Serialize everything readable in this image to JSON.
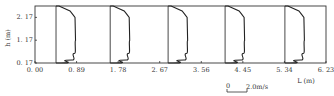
{
  "chart_data": {
    "type": "line",
    "title": "",
    "xlabel": "L (m)",
    "ylabel": "h (m)",
    "x_ticks": [
      "0.00",
      "0.89",
      "1.78",
      "2.67",
      "3.56",
      "4.45",
      "5.34",
      "6.23"
    ],
    "y_ticks": [
      "0.17",
      "1.17",
      "2.17"
    ],
    "xlim": [
      0.0,
      6.23
    ],
    "ylim": [
      0.17,
      2.67
    ],
    "grid": false,
    "scale_bar": {
      "label": "2.0m/s",
      "origin_label": "0"
    },
    "series": [
      {
        "name": "profile-1",
        "baseline_x": 0.45,
        "h": [
          0.17,
          0.3,
          0.6,
          1.17,
          2.17,
          2.45,
          2.67
        ],
        "u": [
          0.5,
          1.6,
          1.9,
          1.95,
          1.9,
          1.4,
          0.3
        ]
      },
      {
        "name": "profile-2",
        "baseline_x": 1.61,
        "h": [
          0.17,
          0.3,
          0.6,
          1.17,
          2.17,
          2.45,
          2.67
        ],
        "u": [
          0.5,
          1.6,
          1.9,
          1.95,
          1.9,
          1.4,
          0.3
        ]
      },
      {
        "name": "profile-3",
        "baseline_x": 2.85,
        "h": [
          0.17,
          0.3,
          0.6,
          1.17,
          2.17,
          2.45,
          2.67
        ],
        "u": [
          0.5,
          1.6,
          1.9,
          1.95,
          1.9,
          1.4,
          0.3
        ]
      },
      {
        "name": "profile-4",
        "baseline_x": 4.07,
        "h": [
          0.17,
          0.3,
          0.6,
          1.17,
          2.17,
          2.45,
          2.67
        ],
        "u": [
          0.5,
          1.6,
          1.9,
          1.95,
          1.9,
          1.4,
          0.3
        ]
      },
      {
        "name": "profile-5",
        "baseline_x": 5.35,
        "h": [
          0.17,
          0.3,
          0.6,
          1.17,
          2.17,
          2.45,
          2.67
        ],
        "u": [
          0.5,
          1.6,
          1.9,
          1.95,
          1.9,
          1.4,
          0.3
        ]
      }
    ]
  },
  "labels": {
    "x_axis": "L (m)",
    "y_axis": "h (m)",
    "scale_zero": "0",
    "scale_text": "2.0m/s"
  }
}
